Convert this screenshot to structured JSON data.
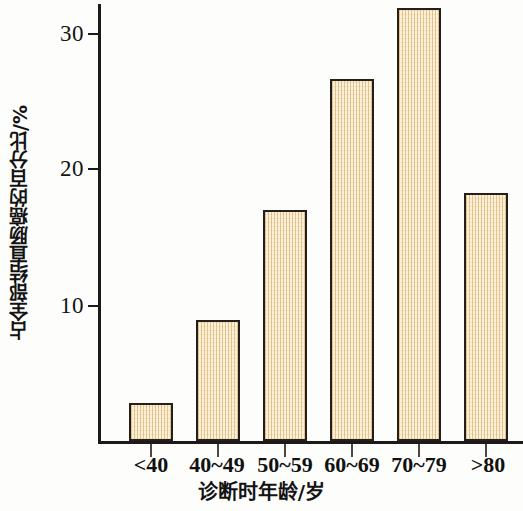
{
  "chart_data": {
    "type": "bar",
    "title": "",
    "subtitle": "",
    "xlabel": "诊断时年龄/岁",
    "ylabel": "占全部结直肠癌的百分比/%",
    "categories": [
      "<40",
      "40~49",
      "50~59",
      "60~69",
      "70~79",
      ">80"
    ],
    "values": [
      2.8,
      8.9,
      16.9,
      26.5,
      31.7,
      18.2
    ],
    "series": [
      {
        "name": "占全部结直肠癌的百分比",
        "values": [
          2.8,
          8.9,
          16.9,
          26.5,
          31.7,
          18.2
        ]
      }
    ],
    "ylim": [
      0,
      32.5
    ],
    "y_ticks": [
      10,
      20,
      30
    ],
    "y_tick_labels": [
      "10",
      "20",
      "30"
    ],
    "grid": false,
    "legend": false,
    "legend_position": "none",
    "bar_fill_color": "#F0DAB0",
    "bar_edge_color": "#241F1B",
    "axis_color": "#1C1A18",
    "background_color": "#FDFDFC"
  },
  "axes": {
    "y": {
      "label": "占全部结直肠癌的百分比/%",
      "ticks": [
        {
          "label": "30",
          "value": 30
        },
        {
          "label": "20",
          "value": 20
        },
        {
          "label": "10",
          "value": 10
        }
      ]
    },
    "x": {
      "label": "诊断时年龄/岁",
      "ticks": [
        {
          "label": "<40",
          "value": 2.8
        },
        {
          "label": "40~49",
          "value": 8.9
        },
        {
          "label": "50~59",
          "value": 16.9
        },
        {
          "label": "60~69",
          "value": 26.5
        },
        {
          "label": "70~79",
          "value": 31.7
        },
        {
          "label": ">80",
          "value": 18.2
        }
      ]
    }
  }
}
